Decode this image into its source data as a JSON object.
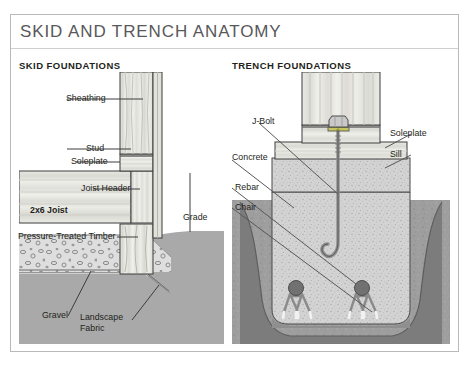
{
  "title": "SKID AND TRENCH ANATOMY",
  "panels": [
    {
      "id": "skid",
      "heading": "SKID FOUNDATIONS",
      "labels": [
        {
          "name": "sheathing",
          "text": "Sheathing"
        },
        {
          "name": "stud",
          "text": "Stud"
        },
        {
          "name": "soleplate",
          "text": "Soleplate"
        },
        {
          "name": "joist-header",
          "text": "Joist Header"
        },
        {
          "name": "joist",
          "text": "2x6 Joist"
        },
        {
          "name": "pressure-treated-timber",
          "text": "Pressure-Treated Timber"
        },
        {
          "name": "grade",
          "text": "Grade"
        },
        {
          "name": "gravel",
          "text": "Gravel"
        },
        {
          "name": "landscape-fabric-line1",
          "text": "Landscape"
        },
        {
          "name": "landscape-fabric-line2",
          "text": "Fabric"
        }
      ]
    },
    {
      "id": "trench",
      "heading": "TRENCH FOUNDATIONS",
      "labels": [
        {
          "name": "j-bolt",
          "text": "J-Bolt"
        },
        {
          "name": "soleplate",
          "text": "Soleplate"
        },
        {
          "name": "sill",
          "text": "Sill"
        },
        {
          "name": "concrete",
          "text": "Concrete"
        },
        {
          "name": "rebar",
          "text": "Rebar"
        },
        {
          "name": "chair",
          "text": "Chair"
        }
      ]
    }
  ],
  "colors": {
    "frame_border": "#b9b9b9",
    "title_text": "#58585a",
    "label_text": "#231f20",
    "soil_solid": "#a7a7a7",
    "soil_dark": "#787878",
    "gravel_fill": "#dcdcdc",
    "gravel_stone": "#8d8d8d",
    "concrete_fill": "#d2d2d2",
    "wood_light": "#e9e9e4",
    "wood_mid": "#d4d4ce",
    "wood_line": "#58585a",
    "outline": "#3c3c3c",
    "rebar_dot": "#6e6e6e",
    "metal": "#9a9a9a"
  }
}
